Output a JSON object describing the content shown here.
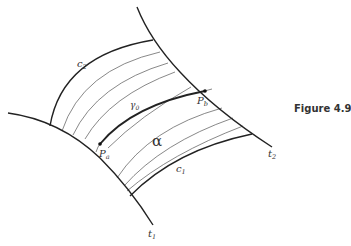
{
  "figure": {
    "caption": "Figure 4.9",
    "labels": {
      "c2": "c",
      "c2_sub": "2",
      "c1": "c",
      "c1_sub": "1",
      "t1": "t",
      "t1_sub": "1",
      "t2": "t",
      "t2_sub": "2",
      "gamma": "γ",
      "gamma_sub": "0",
      "pa": "P",
      "pa_sub": "a",
      "pb": "P",
      "pb_sub": "b",
      "region": "α"
    },
    "colors": {
      "stroke": "#222222",
      "thin_stroke": "#555555",
      "text": "#333333"
    }
  }
}
